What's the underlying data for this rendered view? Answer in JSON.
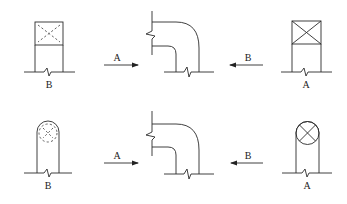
{
  "diagram": {
    "rows": [
      {
        "section": "square",
        "left_view": {
          "label": "B",
          "symbol": "dashed-cross (hidden, far side)"
        },
        "arrow_left": {
          "label": "A",
          "direction": "right"
        },
        "arrow_right": {
          "label": "B",
          "direction": "left"
        },
        "right_view": {
          "label": "A",
          "symbol": "solid-cross (visible, near side)"
        }
      },
      {
        "section": "round",
        "left_view": {
          "label": "B",
          "symbol": "dashed-circle-cross (hidden, far side)"
        },
        "arrow_left": {
          "label": "A",
          "direction": "right"
        },
        "arrow_right": {
          "label": "B",
          "direction": "left"
        },
        "right_view": {
          "label": "A",
          "symbol": "circle-cross (visible, near side)"
        }
      }
    ]
  }
}
